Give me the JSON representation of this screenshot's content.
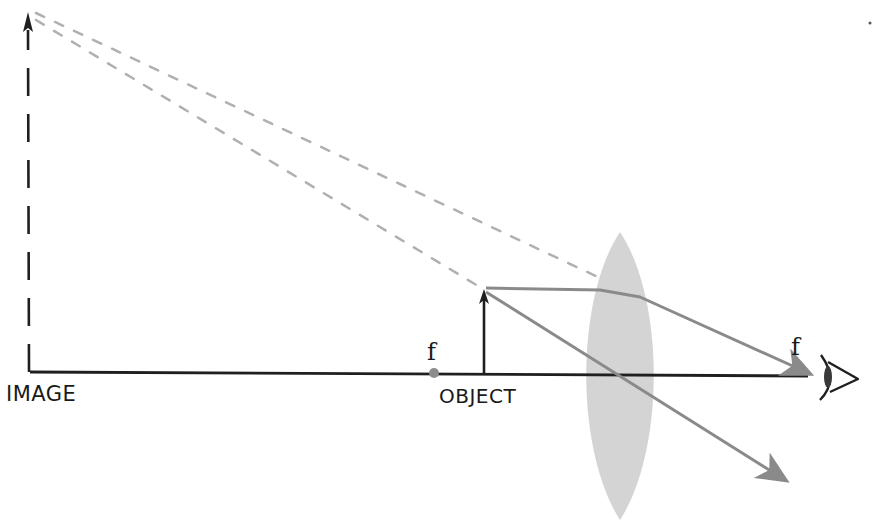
{
  "diagram": {
    "labels": {
      "image": "IMAGE",
      "object": "OBJECT",
      "focal_left": "f",
      "focal_right": "f"
    },
    "colors": {
      "ink": "#1f1f1f",
      "ray": "#8a8a8a",
      "virtual_ray": "#b0b0b0",
      "lens": "#d4d4d4",
      "focal_point": "#8c8c8c"
    },
    "elements": {
      "optical_axis": {
        "x1": 30,
        "y1": 372,
        "x2": 808,
        "y2": 376
      },
      "object_arrow": {
        "x": 484,
        "base_y": 373,
        "tip_y": 289
      },
      "image_arrow": {
        "x": 29,
        "base_y": 372,
        "tip_y": 12,
        "style": "dashed"
      },
      "lens": {
        "cx": 620,
        "top": 232,
        "bottom": 520,
        "half_width": 33
      },
      "focal_point_left": {
        "x": 434,
        "y": 373
      },
      "focal_point_right": {
        "x": 808,
        "y": 376
      },
      "eye": {
        "x": 826,
        "y": 376
      }
    }
  }
}
